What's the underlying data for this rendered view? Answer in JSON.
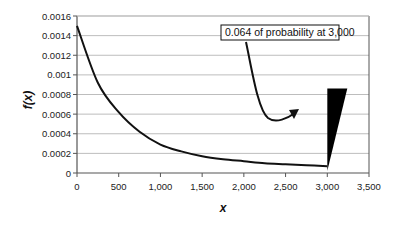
{
  "chart_data": {
    "type": "line",
    "title": "",
    "xlabel": "x",
    "ylabel": "f(x)",
    "xlim": [
      0,
      3500
    ],
    "ylim": [
      0,
      0.0016
    ],
    "grid": true,
    "legend": "none",
    "x_ticks": [
      "0",
      "500",
      "1,000",
      "1,500",
      "2,000",
      "2,500",
      "3,000",
      "3,500"
    ],
    "y_ticks": [
      "0",
      "0.0002",
      "0.0004",
      "0.0006",
      "0.0008",
      "0.001",
      "0.0012",
      "0.0014",
      "0.0016"
    ],
    "series": [
      {
        "name": "f(x) density",
        "x": [
          0,
          250,
          500,
          750,
          1000,
          1250,
          1500,
          1750,
          2000,
          2250,
          2500,
          2750,
          3000
        ],
        "values": [
          0.0015,
          0.00092,
          0.00062,
          0.00042,
          0.00029,
          0.00022,
          0.00017,
          0.00014,
          0.00012,
          0.0001,
          9e-05,
          8e-05,
          7e-05
        ]
      },
      {
        "name": "point mass at 3,000",
        "type": "spike",
        "x": 3000,
        "height": 0.00086,
        "probability": 0.064
      }
    ],
    "annotations": [
      {
        "text": "0.064 of probability at 3,000",
        "points_to": {
          "x": 3000,
          "y": 0.0006
        }
      }
    ]
  },
  "labels": {
    "xlabel": "x",
    "ylabel": "f(x)",
    "annotation": "0.064 of probability at 3,000"
  },
  "colors": {
    "curve": "#111111",
    "grid": "#bdbdbd",
    "axis": "#555555",
    "spike": "#000000"
  }
}
